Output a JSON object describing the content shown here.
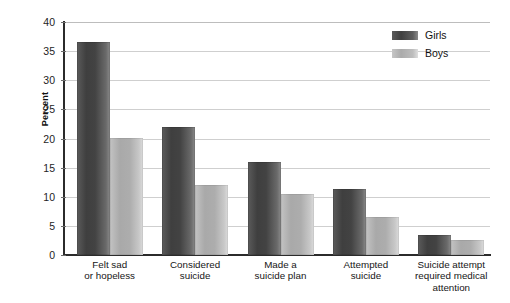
{
  "chart_data": {
    "type": "bar",
    "title": "",
    "xlabel": "",
    "ylabel": "Percent",
    "ylim": [
      0,
      40
    ],
    "yticks": [
      0,
      5,
      10,
      15,
      20,
      25,
      30,
      35,
      40
    ],
    "grid": true,
    "legend_position": "top-right",
    "categories": [
      "Felt sad\nor hopeless",
      "Considered\nsuicide",
      "Made a\nsuicide plan",
      "Attempted\nsuicide",
      "Suicide attempt\nrequired medical\nattention"
    ],
    "category_lines": [
      [
        "Felt sad",
        "or hopeless"
      ],
      [
        "Considered",
        "suicide"
      ],
      [
        "Made a",
        "suicide plan"
      ],
      [
        "Attempted",
        "suicide"
      ],
      [
        "Suicide attempt",
        "required medical",
        "attention"
      ]
    ],
    "series": [
      {
        "name": "Girls",
        "color": "#454545",
        "values": [
          36.6,
          22.0,
          16.0,
          11.3,
          3.5
        ]
      },
      {
        "name": "Boys",
        "color": "#b2b2b2",
        "values": [
          20.1,
          12.0,
          10.4,
          6.5,
          2.5
        ]
      }
    ]
  },
  "axis": {
    "y_title": "Percent",
    "tick_labels": [
      "40",
      "35",
      "30",
      "25",
      "20",
      "15",
      "10",
      "5",
      "0"
    ]
  },
  "legend": {
    "items": [
      {
        "label": "Girls"
      },
      {
        "label": "Boys"
      }
    ]
  }
}
